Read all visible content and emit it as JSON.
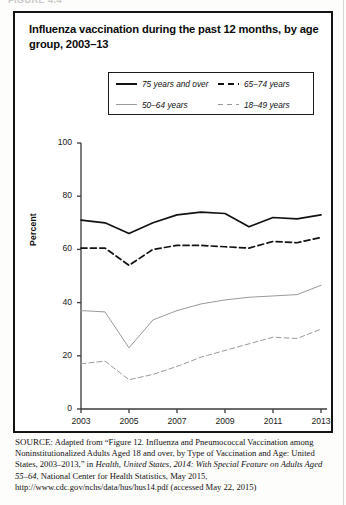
{
  "crop_header": "FIGURE 4.4",
  "figure": {
    "title": "Influenza vaccination during the past 12 months, by age group, 2003–13",
    "legend": [
      {
        "label": "75 years and over",
        "style": "solid-dark"
      },
      {
        "label": "65–74 years",
        "style": "dash-dark"
      },
      {
        "label": "50–64 years",
        "style": "solid-gray"
      },
      {
        "label": "18–49 years",
        "style": "dash-gray"
      }
    ]
  },
  "axis": {
    "y_label": "Percent",
    "y_ticks": [
      "0",
      "20",
      "40",
      "60",
      "80",
      "100"
    ],
    "x_ticks": [
      "2003",
      "2005",
      "2007",
      "2009",
      "2011",
      "2013"
    ]
  },
  "source": {
    "prefix": "SOURCE:",
    "line1": " Adapted from “Figure 12. Influenza and Pneumococcal Vaccination among Noninstitutionalized Adults Aged 18 and over, by Type of Vaccination and Age: United States, 2003–2013,” in ",
    "italic1": "Health, United States, 2014: With Special Feature on Adults Aged 55–64",
    "line2": ", National Center for Health Statistics, May 2015, http://www.cdc.gov/nchs/data/hus/hus14.pdf (accessed May 22, 2015)"
  },
  "colors": {
    "dark_line": "#121212",
    "gray_line": "#9a9a9a",
    "axis": "#3a3a3a",
    "frame": "#141414"
  },
  "chart_data": {
    "type": "line",
    "title": "Influenza vaccination during the past 12 months, by age group, 2003–13",
    "xlabel": "",
    "ylabel": "Percent",
    "ylim": [
      0,
      100
    ],
    "xlim": [
      2003,
      2013
    ],
    "grid": false,
    "legend_position": "top-center",
    "x": [
      2003,
      2004,
      2005,
      2006,
      2007,
      2008,
      2009,
      2010,
      2011,
      2012,
      2013
    ],
    "series": [
      {
        "name": "75 years and over",
        "style": "solid-dark",
        "values": [
          71.0,
          70.0,
          66.0,
          70.0,
          73.0,
          74.0,
          73.5,
          68.5,
          72.0,
          71.5,
          73.0
        ]
      },
      {
        "name": "65–74 years",
        "style": "dash-dark",
        "values": [
          60.5,
          60.5,
          54.0,
          60.0,
          61.5,
          61.5,
          61.0,
          60.5,
          63.0,
          62.5,
          64.5
        ]
      },
      {
        "name": "50–64 years",
        "style": "solid-gray",
        "values": [
          37.0,
          36.5,
          23.0,
          33.5,
          37.0,
          39.5,
          41.0,
          42.0,
          42.5,
          43.0,
          46.5
        ]
      },
      {
        "name": "18–49 years",
        "style": "dash-gray",
        "values": [
          17.0,
          18.0,
          11.0,
          13.0,
          16.0,
          19.5,
          22.0,
          24.5,
          27.0,
          26.5,
          30.0
        ]
      }
    ]
  }
}
